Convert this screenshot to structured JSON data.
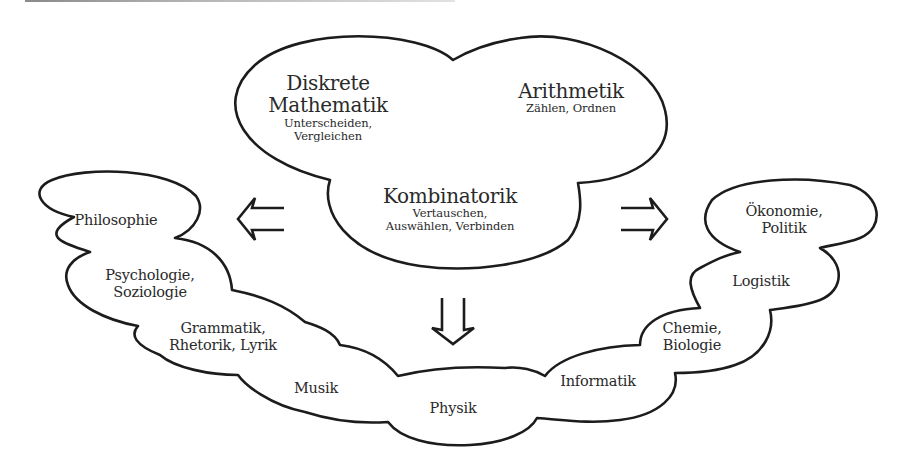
{
  "diagram": {
    "type": "concept-cloud",
    "center_cloud": {
      "topics": [
        {
          "title": "Diskrete Mathematik",
          "title_lines": [
            "Diskrete",
            "Mathematik"
          ],
          "subtitle_lines": [
            "Unterscheiden,",
            "Vergleichen"
          ]
        },
        {
          "title": "Arithmetik",
          "title_lines": [
            "Arithmetik"
          ],
          "subtitle_lines": [
            "Zählen, Ordnen"
          ]
        },
        {
          "title": "Kombinatorik",
          "title_lines": [
            "Kombinatorik"
          ],
          "subtitle_lines": [
            "Vertauschen,",
            "Auswählen, Verbinden"
          ]
        }
      ]
    },
    "arrows": [
      {
        "name": "arrow-left",
        "direction": "left",
        "icon": "double-arrow-left-icon"
      },
      {
        "name": "arrow-right",
        "direction": "right",
        "icon": "double-arrow-right-icon"
      },
      {
        "name": "arrow-down",
        "direction": "down",
        "icon": "double-arrow-down-icon"
      }
    ],
    "application_cloud": {
      "nodes": [
        {
          "lines": [
            "Philosophie"
          ]
        },
        {
          "lines": [
            "Psychologie,",
            "Soziologie"
          ]
        },
        {
          "lines": [
            "Grammatik,",
            "Rhetorik, Lyrik"
          ]
        },
        {
          "lines": [
            "Musik"
          ]
        },
        {
          "lines": [
            "Physik"
          ]
        },
        {
          "lines": [
            "Informatik"
          ]
        },
        {
          "lines": [
            "Chemie,",
            "Biologie"
          ]
        },
        {
          "lines": [
            "Logistik"
          ]
        },
        {
          "lines": [
            "Ökonomie,",
            "Politik"
          ]
        }
      ]
    },
    "colors": {
      "stroke": "#1c1c1c",
      "text": "#2a2a2a",
      "background": "#ffffff"
    }
  }
}
